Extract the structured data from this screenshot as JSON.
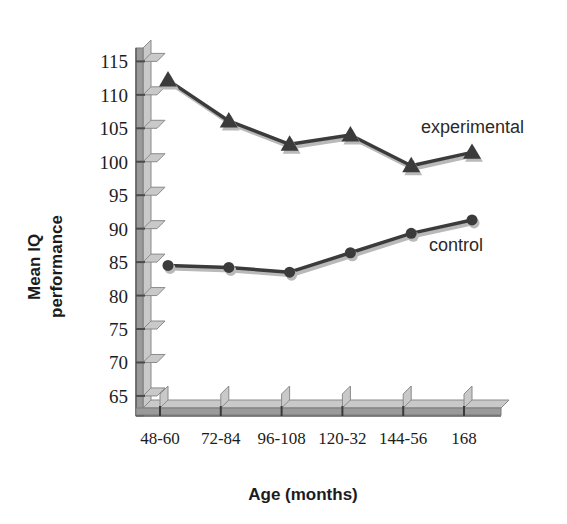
{
  "chart_data": {
    "type": "line",
    "title": "",
    "xlabel": "Age (months)",
    "ylabel": "Mean IQ performance",
    "categories": [
      "48-60",
      "72-84",
      "96-108",
      "120-32",
      "144-56",
      "168"
    ],
    "yticks": [
      65,
      70,
      75,
      80,
      85,
      90,
      95,
      100,
      105,
      110,
      115
    ],
    "ylim": [
      62,
      117
    ],
    "grid": false,
    "legend_position": "inline-right",
    "series": [
      {
        "name": "experimental",
        "marker": "triangle",
        "color": "#3b3b3b",
        "values": [
          112.2,
          106.1,
          102.6,
          104.0,
          99.4,
          101.4
        ]
      },
      {
        "name": "control",
        "marker": "circle",
        "color": "#3b3b3b",
        "values": [
          84.5,
          84.2,
          83.5,
          86.4,
          89.3,
          91.3
        ]
      }
    ]
  },
  "labels": {
    "y_axis_line1": "Mean IQ",
    "y_axis_line2": "performance",
    "x_axis_title": "Age (months)",
    "series_experimental": "experimental",
    "series_control": "control"
  },
  "colors": {
    "background": "#ffffff",
    "axis": "#6f6f6f",
    "axis_face": "#9a9a9a",
    "axis_top": "#c9c9c9",
    "line": "#3b3b3b",
    "line_shadow": "#b9b9b9",
    "text": "#1c1c1c"
  }
}
